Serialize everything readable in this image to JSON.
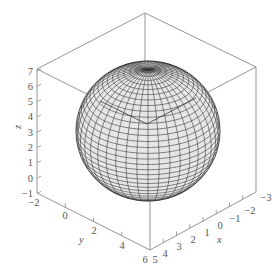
{
  "chart_data": {
    "type": "surface3d",
    "title": "",
    "surface": {
      "shape": "sphere",
      "center": {
        "x": 1,
        "y": 2,
        "z": 3
      },
      "radius": 4,
      "mesh_color": "#2a2a2a",
      "fill_color": "#e6e6e6"
    },
    "axes": {
      "x": {
        "label": "x",
        "range": [
          -3,
          5
        ],
        "ticks": [
          "5",
          "4",
          "3",
          "2",
          "1",
          "0",
          "−1",
          "−2",
          "−3"
        ]
      },
      "y": {
        "label": "y",
        "range": [
          -2,
          6
        ],
        "ticks": [
          "−2",
          "0",
          "2",
          "4",
          "6"
        ]
      },
      "z": {
        "label": "z",
        "range": [
          -1,
          7
        ],
        "ticks": [
          "7",
          "6",
          "5",
          "4",
          "3",
          "2",
          "1",
          "0",
          "−1"
        ]
      }
    },
    "box": true,
    "grid": false,
    "legend": null,
    "box_color": "#8a8a8a"
  },
  "labels": {
    "z_axis": "z",
    "y_axis": "y",
    "x_axis": "x",
    "z_ticks": [
      "7",
      "6",
      "5",
      "4",
      "3",
      "2",
      "1",
      "0",
      "−1"
    ],
    "y_ticks": [
      "−2",
      "0",
      "2",
      "4",
      "6"
    ],
    "x_ticks": [
      "5",
      "4",
      "3",
      "2",
      "1",
      "0",
      "−1",
      "−2",
      "−3"
    ]
  }
}
